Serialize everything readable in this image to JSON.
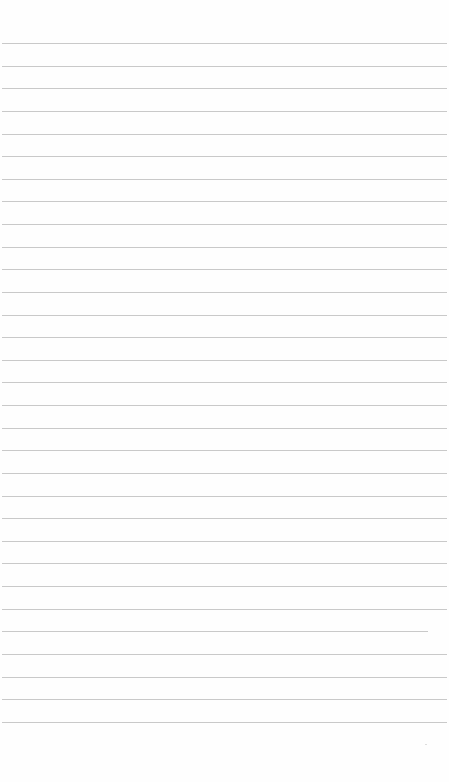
{
  "page": {
    "type": "lined-paper",
    "background_color": "#fefefe",
    "rule_color": "#c9c9c9",
    "rule_count": 31,
    "first_rule_y": 43,
    "rule_spacing": 22.63,
    "rule_left": 2,
    "rule_right": 447,
    "short_rule": {
      "index": 26,
      "right": 428
    },
    "text_lines": []
  }
}
